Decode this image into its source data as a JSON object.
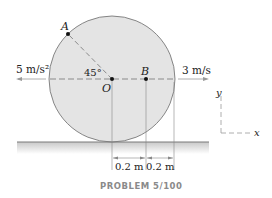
{
  "diagram": {
    "point_A": "A",
    "point_O": "O",
    "point_B": "B",
    "angle_label": "45°",
    "acceleration_label": "5 m/s²",
    "velocity_label": "3 m/s",
    "axis_y": "y",
    "axis_x": "x",
    "dim_left": "0.2 m",
    "dim_right": "0.2 m",
    "caption": "PROBLEM 5/100",
    "colors": {
      "disk_fill": "#e4e4e4",
      "disk_stroke": "#6a6a6a",
      "ground_line": "#7a7a7a",
      "dash_line": "#8a8a8a",
      "caption": "#8a8a8a"
    }
  }
}
